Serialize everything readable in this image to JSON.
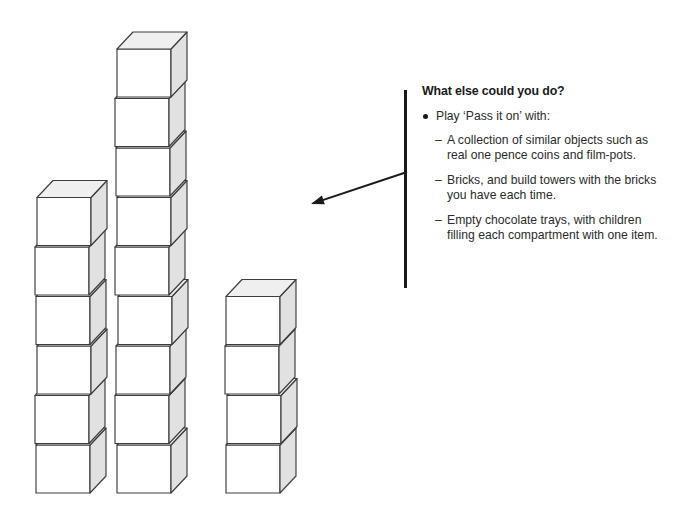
{
  "illustration": {
    "description": "Three isometric cube towers of differing heights",
    "arrow": {
      "name": "pointer-arrow",
      "from": [
        407,
        172
      ],
      "to": [
        311,
        204
      ]
    },
    "rule_bar_color": "#1a1a1a",
    "cube_colors": {
      "left_face": "#ffffff",
      "right_face": "#e1e1e1",
      "top_face": "#efefef",
      "outline": "#3c3c3c"
    },
    "towers": [
      {
        "name": "tower-left",
        "cube_count": 6,
        "x": 36,
        "bottom_y": 493,
        "cube_width": 54,
        "cube_height": 48,
        "depth_x": 16,
        "depth_y": -17,
        "jitter": [
          0,
          -1,
          1,
          0,
          -1,
          1
        ]
      },
      {
        "name": "tower-middle",
        "cube_count": 9,
        "x": 116,
        "bottom_y": 493,
        "cube_width": 54,
        "cube_height": 48,
        "depth_x": 16,
        "depth_y": -17,
        "jitter": [
          1,
          -1,
          0,
          2,
          -1,
          1,
          0,
          -1,
          1
        ]
      },
      {
        "name": "tower-right",
        "cube_count": 4,
        "x": 226,
        "bottom_y": 493,
        "cube_width": 54,
        "cube_height": 48,
        "depth_x": 16,
        "depth_y": -17,
        "jitter": [
          0,
          1,
          -1,
          0
        ]
      }
    ]
  },
  "text_panel": {
    "heading": "What else could you do?",
    "bullets": [
      {
        "marker": "bullet-dot",
        "text": "Play ‘Pass it on’ with:"
      }
    ],
    "sub_items": [
      {
        "marker": "–",
        "text": "A collection of similar objects such as real one pence coins and film-pots."
      },
      {
        "marker": "–",
        "text": "Bricks, and build towers with the bricks you have each time."
      },
      {
        "marker": "–",
        "text": "Empty chocolate trays, with children filling each compartment with one item."
      }
    ]
  }
}
